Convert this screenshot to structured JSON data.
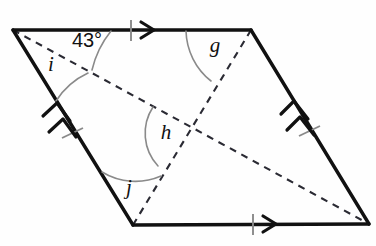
{
  "figure": {
    "kind": "parallelogram-with-diagonals",
    "background_color": "#fefefe",
    "stroke_color": "#111111",
    "dashed_color": "#2a2a33",
    "arc_color": "#8a8a8a"
  },
  "vertices": {
    "top_left": {
      "name": "A",
      "x": 13,
      "y": 30
    },
    "top_right": {
      "name": "B",
      "x": 251,
      "y": 30
    },
    "bottom_right": {
      "name": "C",
      "x": 369,
      "y": 224
    },
    "bottom_left": {
      "name": "D",
      "x": 133,
      "y": 225
    },
    "diagonal_intersection": {
      "name": "E",
      "x": 190,
      "y": 128
    }
  },
  "sides": [
    {
      "name": "top-side",
      "from": "A",
      "to": "B",
      "marks": "single-arrow-single-tick"
    },
    {
      "name": "right-side",
      "from": "B",
      "to": "C",
      "marks": "double-arrow-single-tick"
    },
    {
      "name": "bottom-side",
      "from": "D",
      "to": "C",
      "marks": "single-arrow-single-tick"
    },
    {
      "name": "left-side",
      "from": "A",
      "to": "D",
      "marks": "double-arrow-single-tick"
    }
  ],
  "diagonals": [
    {
      "name": "diagonal-a-c",
      "from": "A",
      "to": "C",
      "style": "dashed"
    },
    {
      "name": "diagonal-d-b",
      "from": "D",
      "to": "B",
      "style": "dashed"
    }
  ],
  "angles": [
    {
      "id": "angle-43",
      "label": "43°",
      "value": 43,
      "unit": "degrees",
      "known": true,
      "vertex": "A",
      "label_x": 87,
      "label_y": 42,
      "description": "angle between top side AB and diagonal AC at vertex A"
    },
    {
      "id": "angle-i",
      "label": "i",
      "known": false,
      "vertex": "A",
      "label_x": 51,
      "label_y": 66,
      "description": "angle between diagonal AC and left side AD at vertex A"
    },
    {
      "id": "angle-g",
      "label": "g",
      "known": false,
      "vertex": "B",
      "label_x": 215,
      "label_y": 47,
      "description": "angle between top side BA and diagonal BD at vertex B"
    },
    {
      "id": "angle-h",
      "label": "h",
      "known": false,
      "vertex": "E",
      "label_x": 166,
      "label_y": 134,
      "description": "angle at intersection of the two diagonals, opening toward the left"
    },
    {
      "id": "angle-j",
      "label": "j",
      "known": false,
      "vertex": "D",
      "label_x": 129,
      "label_y": 189,
      "description": "angle between left side DA and diagonal DB at vertex D"
    }
  ]
}
